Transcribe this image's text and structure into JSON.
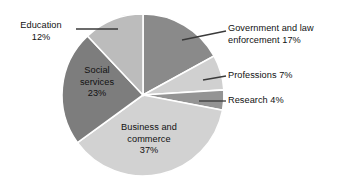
{
  "chart_data": {
    "type": "pie",
    "title": "",
    "subtitle": "",
    "xlabel": "",
    "ylabel": "",
    "legend_position": "none",
    "grid": false,
    "units": "percent",
    "total": 100,
    "start_angle_deg": 0,
    "direction": "clockwise",
    "categories": [
      "Government and law enforcement",
      "Professions",
      "Research",
      "Business and commerce",
      "Social services",
      "Education"
    ],
    "values": [
      17,
      7,
      4,
      37,
      23,
      12
    ],
    "slices": [
      {
        "name": "Government and law enforcement",
        "value": 17,
        "percent_text": "17%",
        "label_text": "Government and law\nenforcement 17%",
        "color": "#8a8a8a",
        "label_placement": "outside-right",
        "leader_line": true,
        "start_deg": 0,
        "end_deg": 61.2
      },
      {
        "name": "Professions",
        "value": 7,
        "percent_text": "7%",
        "label_text": "Professions 7%",
        "color": "#d0d0d0",
        "label_placement": "outside-right",
        "leader_line": true,
        "start_deg": 61.2,
        "end_deg": 86.4
      },
      {
        "name": "Research",
        "value": 4,
        "percent_text": "4%",
        "label_text": "Research 4%",
        "color": "#949494",
        "label_placement": "outside-right",
        "leader_line": true,
        "start_deg": 86.4,
        "end_deg": 100.8
      },
      {
        "name": "Business and commerce",
        "value": 37,
        "percent_text": "37%",
        "label_text": "Business and\ncommerce\n37%",
        "color": "#d2d2d2",
        "label_placement": "inside",
        "leader_line": false,
        "start_deg": 100.8,
        "end_deg": 234.0
      },
      {
        "name": "Social services",
        "value": 23,
        "percent_text": "23%",
        "label_text": "Social\nservices\n23%",
        "color": "#7d7d7d",
        "label_placement": "inside",
        "leader_line": false,
        "start_deg": 234.0,
        "end_deg": 316.8
      },
      {
        "name": "Education",
        "value": 12,
        "percent_text": "12%",
        "label_text": "Education\n12%",
        "color": "#bcbcbc",
        "label_placement": "outside-left",
        "leader_line": true,
        "start_deg": 316.8,
        "end_deg": 360.0
      }
    ],
    "geometry": {
      "center_x": 143,
      "center_y": 95,
      "radius": 81,
      "slice_border_color": "#ffffff"
    }
  },
  "labels": {
    "government": "Government and law\nenforcement 17%",
    "professions": "Professions 7%",
    "research": "Research 4%",
    "business": "Business and\ncommerce\n37%",
    "social": "Social\nservices\n23%",
    "education": "Education\n12%"
  },
  "colors": {
    "background": "#ffffff",
    "text": "#111111",
    "leader_line": "#3a3a3a",
    "slice_border": "#ffffff",
    "government": "#8a8a8a",
    "professions": "#d0d0d0",
    "research": "#949494",
    "business": "#d2d2d2",
    "social": "#7d7d7d",
    "education": "#bcbcbc"
  }
}
